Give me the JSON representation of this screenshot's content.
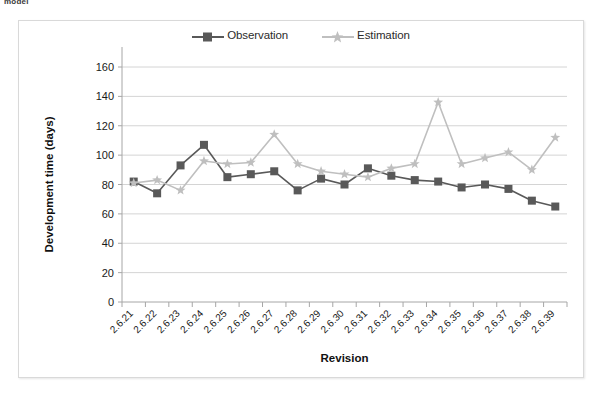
{
  "page": {
    "clipped_caption": "model"
  },
  "chart_data": {
    "type": "line",
    "title": "",
    "subtitle": "",
    "xlabel": "Revision",
    "ylabel": "Development time (days)",
    "ylim": [
      0,
      160
    ],
    "ytick_step": 20,
    "yticks": [
      0,
      20,
      40,
      60,
      80,
      100,
      120,
      140,
      160
    ],
    "grid": true,
    "grid_axis": "y",
    "legend_position": "top-center",
    "categories": [
      "2.6.21",
      "2.6.22",
      "2.6.23",
      "2.6.24",
      "2.6.25",
      "2.6.26",
      "2.6.27",
      "2.6.28",
      "2.6.29",
      "2.6.30",
      "2.6.31",
      "2.6.32",
      "2.6.33",
      "2.6.34",
      "2.6.35",
      "2.6.36",
      "2.6.37",
      "2.6.38",
      "2.6.39"
    ],
    "series": [
      {
        "name": "Observation",
        "color": "#595959",
        "marker": "square",
        "values": [
          82,
          74,
          93,
          107,
          85,
          87,
          89,
          76,
          84,
          80,
          91,
          86,
          83,
          82,
          78,
          80,
          77,
          69,
          65
        ]
      },
      {
        "name": "Estimation",
        "color": "#bfbfbf",
        "marker": "star",
        "values": [
          81,
          83,
          76,
          96,
          94,
          95,
          114,
          94,
          89,
          87,
          85,
          91,
          94,
          136,
          94,
          98,
          102,
          90,
          112
        ]
      }
    ]
  },
  "colors": {
    "observation": "#595959",
    "estimation": "#bfbfbf",
    "grid": "#d4d4d4",
    "axis": "#a6a6a6",
    "frame_border": "#d9d9d9",
    "text": "#1a1a1a",
    "background": "#ffffff"
  }
}
